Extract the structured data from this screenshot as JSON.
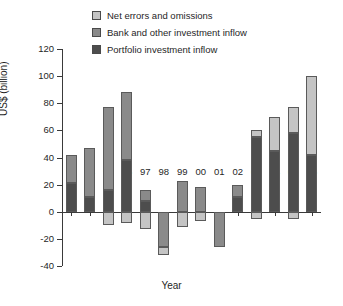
{
  "chart_data": {
    "type": "bar",
    "title": "",
    "subtitle": "",
    "stacked": true,
    "xlabel": "Year",
    "ylabel": "US$ (billion)",
    "ylim": [
      -40,
      120
    ],
    "ytick_values": [
      120,
      100,
      80,
      60,
      40,
      20,
      0,
      -20,
      -40
    ],
    "ytick_labels": [
      "120",
      "100",
      "80",
      "60",
      "40",
      "20",
      "0",
      "-20",
      "-40"
    ],
    "grid": false,
    "legend_position": "top",
    "categories": [
      "93",
      "94",
      "95",
      "96",
      "97",
      "98",
      "99",
      "00",
      "01",
      "02",
      "03",
      "04",
      "05",
      "06"
    ],
    "series": [
      {
        "name": "Portfolio investment inflow",
        "color": "#4d4d4d",
        "values": [
          21,
          11,
          16,
          38,
          8,
          0,
          0,
          0,
          0,
          11,
          55,
          45,
          58,
          42
        ]
      },
      {
        "name": "Bank and other investment inflow",
        "color": "#8a8a8a",
        "values": [
          21,
          36,
          61,
          50,
          8,
          -26,
          23,
          18,
          -26,
          9,
          0,
          0,
          0,
          0
        ]
      },
      {
        "name": "Net errors and omissions",
        "color": "#c4c4c4",
        "values": [
          0,
          0,
          -10,
          -8,
          -13,
          -6,
          -11,
          -7,
          0,
          0,
          5,
          25,
          19,
          58
        ]
      }
    ],
    "bars": [
      {
        "year": "93",
        "total_positive": 42,
        "segments": [
          {
            "series": "Portfolio investment inflow",
            "from": 0,
            "to": 21
          },
          {
            "series": "Bank and other investment inflow",
            "from": 21,
            "to": 42
          }
        ]
      },
      {
        "year": "94",
        "total_positive": 47,
        "segments": [
          {
            "series": "Portfolio investment inflow",
            "from": 0,
            "to": 11
          },
          {
            "series": "Bank and other investment inflow",
            "from": 11,
            "to": 47
          }
        ]
      },
      {
        "year": "95",
        "total_positive": 77,
        "segments": [
          {
            "series": "Portfolio investment inflow",
            "from": 0,
            "to": 16
          },
          {
            "series": "Bank and other investment inflow",
            "from": 16,
            "to": 77
          },
          {
            "series": "Net errors and omissions",
            "from": 0,
            "to": -10
          }
        ]
      },
      {
        "year": "96",
        "total_positive": 88,
        "segments": [
          {
            "series": "Portfolio investment inflow",
            "from": 0,
            "to": 38
          },
          {
            "series": "Bank and other investment inflow",
            "from": 38,
            "to": 88
          },
          {
            "series": "Net errors and omissions",
            "from": 0,
            "to": -8
          }
        ]
      },
      {
        "year": "97",
        "total_positive": 16,
        "segments": [
          {
            "series": "Portfolio investment inflow",
            "from": 0,
            "to": 8
          },
          {
            "series": "Bank and other investment inflow",
            "from": 8,
            "to": 16
          },
          {
            "series": "Net errors and omissions",
            "from": 0,
            "to": -13
          }
        ]
      },
      {
        "year": "98",
        "total_positive": 0,
        "segments": [
          {
            "series": "Bank and other investment inflow",
            "from": 0,
            "to": -26
          },
          {
            "series": "Net errors and omissions",
            "from": -26,
            "to": -32
          }
        ]
      },
      {
        "year": "99",
        "total_positive": 23,
        "segments": [
          {
            "series": "Bank and other investment inflow",
            "from": 0,
            "to": 23
          },
          {
            "series": "Net errors and omissions",
            "from": 0,
            "to": -11
          }
        ]
      },
      {
        "year": "00",
        "total_positive": 18,
        "segments": [
          {
            "series": "Bank and other investment inflow",
            "from": 0,
            "to": 18
          },
          {
            "series": "Net errors and omissions",
            "from": 0,
            "to": -7
          }
        ]
      },
      {
        "year": "01",
        "total_positive": 0,
        "segments": [
          {
            "series": "Bank and other investment inflow",
            "from": 0,
            "to": -26
          }
        ]
      },
      {
        "year": "02",
        "total_positive": 20,
        "segments": [
          {
            "series": "Portfolio investment inflow",
            "from": 0,
            "to": 11
          },
          {
            "series": "Bank and other investment inflow",
            "from": 11,
            "to": 20
          }
        ]
      },
      {
        "year": "03",
        "total_positive": 60,
        "segments": [
          {
            "series": "Portfolio investment inflow",
            "from": 0,
            "to": 55
          },
          {
            "series": "Net errors and omissions",
            "from": 55,
            "to": 60
          },
          {
            "series": "Net errors and omissions",
            "from": 0,
            "to": -5
          }
        ]
      },
      {
        "year": "04",
        "total_positive": 70,
        "segments": [
          {
            "series": "Portfolio investment inflow",
            "from": 0,
            "to": 45
          },
          {
            "series": "Net errors and omissions",
            "from": 45,
            "to": 70
          }
        ]
      },
      {
        "year": "05",
        "total_positive": 77,
        "segments": [
          {
            "series": "Portfolio investment inflow",
            "from": 0,
            "to": 58
          },
          {
            "series": "Net errors and omissions",
            "from": 58,
            "to": 77
          },
          {
            "series": "Net errors and omissions",
            "from": 0,
            "to": -5
          }
        ]
      },
      {
        "year": "06",
        "total_positive": 100,
        "segments": [
          {
            "series": "Portfolio investment inflow",
            "from": 0,
            "to": 42
          },
          {
            "series": "Net errors and omissions",
            "from": 42,
            "to": 100
          }
        ]
      }
    ],
    "legend": [
      {
        "label": "Net errors and omissions",
        "color": "#c4c4c4"
      },
      {
        "label": "Bank and other investment inflow",
        "color": "#8a8a8a"
      },
      {
        "label": "Portfolio investment inflow",
        "color": "#4d4d4d"
      }
    ]
  }
}
